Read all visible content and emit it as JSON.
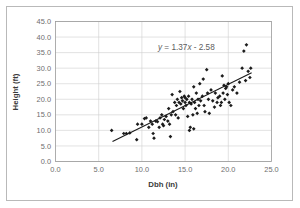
{
  "figure": {
    "border_color": "#b9b9b9",
    "background": "#ffffff"
  },
  "axis_titles": {
    "x": "Dbh (in)",
    "y": "Height (ft)"
  },
  "equation": {
    "full": "y = 1.37x - 2.58",
    "lhs": "y",
    "eq": " = ",
    "slope": "1.37",
    "xvar": "x",
    "intercept": " - 2.58"
  },
  "x_ticks": [
    "0.0",
    "5.0",
    "10.0",
    "15.0",
    "20.0",
    "25.0"
  ],
  "y_ticks": [
    "0.0",
    "5.0",
    "10.0",
    "15.0",
    "20.0",
    "25.0",
    "30.0",
    "35.0",
    "40.0",
    "45.0"
  ],
  "chart_data": {
    "type": "scatter",
    "title": "",
    "xlabel": "Dbh (in)",
    "ylabel": "Height (ft)",
    "xlim": [
      0,
      25
    ],
    "ylim": [
      0,
      45
    ],
    "xticks": [
      0,
      5,
      10,
      15,
      20,
      25
    ],
    "yticks": [
      0,
      5,
      10,
      15,
      20,
      25,
      30,
      35,
      40,
      45
    ],
    "grid": true,
    "legend": false,
    "annotation": "y = 1.37x - 2.58",
    "trendline": {
      "type": "linear",
      "slope": 1.37,
      "intercept": -2.58,
      "x_start": 6.6,
      "x_end": 22.7
    },
    "marker": "diamond",
    "marker_color": "#1c1c1c",
    "points": [
      [
        6.5,
        10.0
      ],
      [
        7.9,
        9.0
      ],
      [
        8.2,
        9.0
      ],
      [
        8.6,
        9.2
      ],
      [
        9.4,
        7.0
      ],
      [
        9.5,
        12.0
      ],
      [
        10.0,
        12.0
      ],
      [
        10.3,
        13.8
      ],
      [
        10.5,
        14.0
      ],
      [
        10.8,
        11.0
      ],
      [
        11.0,
        13.0
      ],
      [
        11.2,
        12.0
      ],
      [
        11.3,
        9.0
      ],
      [
        11.4,
        7.5
      ],
      [
        11.6,
        13.0
      ],
      [
        11.8,
        12.8
      ],
      [
        12.0,
        11.0
      ],
      [
        12.1,
        14.0
      ],
      [
        12.3,
        15.0
      ],
      [
        12.4,
        12.0
      ],
      [
        12.5,
        11.5
      ],
      [
        12.6,
        13.5
      ],
      [
        12.8,
        14.5
      ],
      [
        13.0,
        13.0
      ],
      [
        13.1,
        17.0
      ],
      [
        13.2,
        12.0
      ],
      [
        13.3,
        8.0
      ],
      [
        13.4,
        15.0
      ],
      [
        13.5,
        21.5
      ],
      [
        13.6,
        16.0
      ],
      [
        13.8,
        19.0
      ],
      [
        13.9,
        15.0
      ],
      [
        14.0,
        18.0
      ],
      [
        14.1,
        20.0
      ],
      [
        14.2,
        14.0
      ],
      [
        14.3,
        19.0
      ],
      [
        14.4,
        22.5
      ],
      [
        14.5,
        18.5
      ],
      [
        14.6,
        20.5
      ],
      [
        14.7,
        19.5
      ],
      [
        14.8,
        17.0
      ],
      [
        14.9,
        21.0
      ],
      [
        15.0,
        19.0
      ],
      [
        15.0,
        20.5
      ],
      [
        15.1,
        18.0
      ],
      [
        15.2,
        20.0
      ],
      [
        15.3,
        14.5
      ],
      [
        15.4,
        21.0
      ],
      [
        15.5,
        19.0
      ],
      [
        15.5,
        10.0
      ],
      [
        15.6,
        11.0
      ],
      [
        15.7,
        18.5
      ],
      [
        15.8,
        20.0
      ],
      [
        15.9,
        15.0
      ],
      [
        16.0,
        10.5
      ],
      [
        16.0,
        24.0
      ],
      [
        16.1,
        19.0
      ],
      [
        16.2,
        17.0
      ],
      [
        16.3,
        22.0
      ],
      [
        16.4,
        15.5
      ],
      [
        16.5,
        20.0
      ],
      [
        16.6,
        18.0
      ],
      [
        16.7,
        25.0
      ],
      [
        16.8,
        19.5
      ],
      [
        17.0,
        21.0
      ],
      [
        17.1,
        26.5
      ],
      [
        17.2,
        18.0
      ],
      [
        17.3,
        16.0
      ],
      [
        17.5,
        29.5
      ],
      [
        17.6,
        22.0
      ],
      [
        17.7,
        20.0
      ],
      [
        17.8,
        15.5
      ],
      [
        18.0,
        23.0
      ],
      [
        18.2,
        19.5
      ],
      [
        18.4,
        17.5
      ],
      [
        18.5,
        22.0
      ],
      [
        18.7,
        19.0
      ],
      [
        18.8,
        20.5
      ],
      [
        19.0,
        21.0
      ],
      [
        19.1,
        18.0
      ],
      [
        19.2,
        19.0
      ],
      [
        19.3,
        27.5
      ],
      [
        19.4,
        22.0
      ],
      [
        19.5,
        24.5
      ],
      [
        19.6,
        20.0
      ],
      [
        19.7,
        23.5
      ],
      [
        19.8,
        24.0
      ],
      [
        19.9,
        21.5
      ],
      [
        20.0,
        25.0
      ],
      [
        20.1,
        19.0
      ],
      [
        20.3,
        18.0
      ],
      [
        20.5,
        23.0
      ],
      [
        20.7,
        24.0
      ],
      [
        21.0,
        22.0
      ],
      [
        21.3,
        25.5
      ],
      [
        21.6,
        30.0
      ],
      [
        21.8,
        35.5
      ],
      [
        22.0,
        26.0
      ],
      [
        22.1,
        37.5
      ],
      [
        22.3,
        29.0
      ],
      [
        22.5,
        27.0
      ],
      [
        22.6,
        30.0
      ]
    ]
  }
}
